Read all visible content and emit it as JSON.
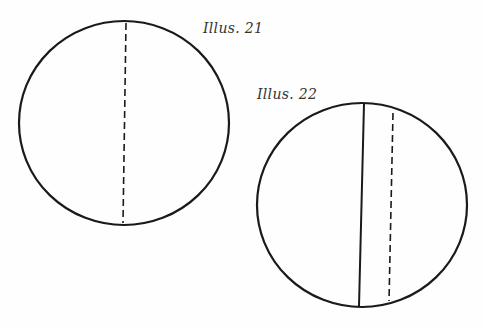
{
  "illustrations": [
    {
      "caption": "Illus. 21",
      "circle": {
        "cx": 124,
        "cy": 123,
        "rx": 105,
        "ry": 102
      },
      "lines": [
        {
          "type": "dashed",
          "x1": 126,
          "y1": 23,
          "x2": 123,
          "y2": 223
        }
      ]
    },
    {
      "caption": "Illus. 22",
      "circle": {
        "cx": 362,
        "cy": 205,
        "rx": 105,
        "ry": 102
      },
      "lines": [
        {
          "type": "solid",
          "x1": 364,
          "y1": 104,
          "x2": 359,
          "y2": 306
        },
        {
          "type": "dashed",
          "x1": 393,
          "y1": 113,
          "x2": 389,
          "y2": 301
        }
      ]
    }
  ],
  "colors": {
    "stroke": "#1a1a1a",
    "background": "#fefefe",
    "caption": "#333333"
  }
}
